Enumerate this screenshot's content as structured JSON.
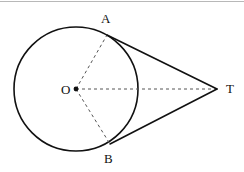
{
  "figure": {
    "width": 244,
    "height": 172,
    "background_color": "#ffffff",
    "stroke_color": "#111111",
    "dash_color": "#555555",
    "top_rule_color": "#b8b8b8"
  },
  "labels": {
    "center": "O",
    "tangent_point_top": "A",
    "tangent_point_bottom": "B",
    "external_point": "T"
  },
  "chart_data": {
    "type": "diagram",
    "circle": {
      "center": {
        "label": "O",
        "x": 76,
        "y": 89
      },
      "radius": 62,
      "stroke": "#111111",
      "stroke_width": 1.6,
      "fill": "none"
    },
    "points": [
      {
        "label": "O",
        "x": 76,
        "y": 89,
        "marker": "filled-dot",
        "label_position": "left"
      },
      {
        "label": "A",
        "x": 107,
        "y": 35,
        "marker": "none",
        "label_position": "above"
      },
      {
        "label": "B",
        "x": 110,
        "y": 144,
        "marker": "none",
        "label_position": "below"
      },
      {
        "label": "T",
        "x": 217,
        "y": 89,
        "marker": "none",
        "label_position": "right"
      }
    ],
    "segments": [
      {
        "name": "tangent-TA",
        "from": "A",
        "to": "T",
        "style": "solid",
        "stroke": "#111111",
        "stroke_width": 1.6
      },
      {
        "name": "tangent-TB",
        "from": "B",
        "to": "T",
        "style": "solid",
        "stroke": "#111111",
        "stroke_width": 1.6
      },
      {
        "name": "radius-OA",
        "from": "O",
        "to": "A",
        "style": "dashed",
        "stroke": "#555555",
        "stroke_width": 1.0
      },
      {
        "name": "radius-OB",
        "from": "O",
        "to": "B",
        "style": "dashed",
        "stroke": "#555555",
        "stroke_width": 1.0
      },
      {
        "name": "axis-OT",
        "from": "O",
        "to": "T",
        "style": "dashed",
        "stroke": "#555555",
        "stroke_width": 1.0
      }
    ],
    "legend": [],
    "grid": false
  }
}
